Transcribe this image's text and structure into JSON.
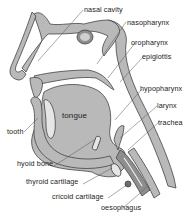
{
  "diagram": {
    "colors": {
      "tissue": "#b9b9b9",
      "tissue_dark": "#8e8e8e",
      "outline": "#444444",
      "cavity": "#ffffff",
      "bone": "#e6e6e6",
      "leader_line": "#555555",
      "background": "#ffffff"
    },
    "labels": [
      {
        "id": "nasal-cavity",
        "text": "nasal cavity",
        "x": 84,
        "y": 6
      },
      {
        "id": "nasopharynx",
        "text": "nasopharynx",
        "x": 127,
        "y": 19
      },
      {
        "id": "oropharynx",
        "text": "oropharynx",
        "x": 131,
        "y": 39
      },
      {
        "id": "epiglottis",
        "text": "epiglottis",
        "x": 142,
        "y": 53
      },
      {
        "id": "hypopharynx",
        "text": "hypopharynx",
        "x": 140,
        "y": 85
      },
      {
        "id": "larynx",
        "text": "larynx",
        "x": 157,
        "y": 102
      },
      {
        "id": "trachea",
        "text": "trachea",
        "x": 158,
        "y": 119
      },
      {
        "id": "tooth",
        "text": "tooth",
        "x": 7,
        "y": 130
      },
      {
        "id": "tongue",
        "text": "tongue",
        "x": 62,
        "y": 114
      },
      {
        "id": "hyoid-bone",
        "text": "hyoid bone",
        "x": 17,
        "y": 163
      },
      {
        "id": "thyroid-cartilage",
        "text": "thyroid cartilage",
        "x": 26,
        "y": 181
      },
      {
        "id": "cricoid-cartilage",
        "text": "cricoid cartilage",
        "x": 52,
        "y": 196
      },
      {
        "id": "oesophagus",
        "text": "oesophagus",
        "x": 101,
        "y": 207
      }
    ]
  }
}
